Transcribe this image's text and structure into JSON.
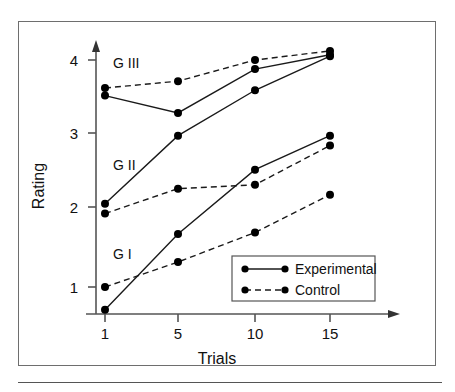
{
  "chart_data": {
    "type": "line",
    "title": "",
    "xlabel": "Trials",
    "ylabel": "Rating",
    "x": [
      1,
      5,
      10,
      15
    ],
    "xtick_labels": [
      "1",
      "5",
      "10",
      "15"
    ],
    "ytick_labels": [
      "1",
      "2",
      "3",
      "4"
    ],
    "yticks": [
      1,
      2,
      3,
      4
    ],
    "xlim": [
      0,
      17.5
    ],
    "ylim": [
      0.55,
      4.35
    ],
    "grid": false,
    "legend_position": "inside-bottom-right",
    "group_annotations": [
      {
        "label": "G III",
        "x": 2.0,
        "y": 4.12
      },
      {
        "label": "G II",
        "x": 2.0,
        "y": 2.73
      },
      {
        "label": "G I",
        "x": 2.0,
        "y": 1.55
      }
    ],
    "series": [
      {
        "name": "G I Experimental",
        "group": "G I",
        "condition": "Experimental",
        "style": "solid",
        "values": [
          0.7,
          1.7,
          2.55,
          3.0
        ]
      },
      {
        "name": "G I Control",
        "group": "G I",
        "condition": "Control",
        "style": "dashed",
        "values": [
          1.0,
          1.33,
          1.72,
          2.22
        ]
      },
      {
        "name": "G II Experimental",
        "group": "G II",
        "condition": "Experimental",
        "style": "solid",
        "values": [
          2.1,
          3.0,
          3.6,
          4.05
        ]
      },
      {
        "name": "G II Control",
        "group": "G II",
        "condition": "Control",
        "style": "dashed",
        "values": [
          1.97,
          2.3,
          2.35,
          2.87
        ]
      },
      {
        "name": "G III Experimental",
        "group": "G III",
        "condition": "Experimental",
        "style": "solid",
        "values": [
          3.53,
          3.3,
          3.88,
          4.07
        ]
      },
      {
        "name": "G III Control",
        "group": "G III",
        "condition": "Control",
        "style": "dashed",
        "values": [
          3.63,
          3.72,
          4.0,
          4.12
        ]
      }
    ],
    "legend": [
      {
        "label": "Experimental",
        "style": "solid"
      },
      {
        "label": "Control",
        "style": "dashed"
      }
    ],
    "colors": {
      "line": "#1a1a1a",
      "marker": "#000000",
      "axis": "#555555",
      "frame": "#6e6e6e",
      "background": "#ffffff"
    }
  },
  "axis": {
    "y_label": "Rating",
    "x_label": "Trials",
    "y_ticks": [
      "4",
      "3",
      "2",
      "1"
    ],
    "x_ticks": [
      "1",
      "5",
      "10",
      "15"
    ]
  },
  "annotations": {
    "g3": "G III",
    "g2": "G II",
    "g1": "G I"
  },
  "legend": {
    "experimental": "Experimental",
    "control": "Control"
  }
}
